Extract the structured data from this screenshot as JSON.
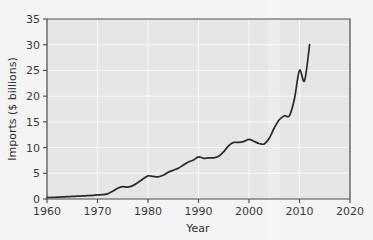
{
  "chart_data": {
    "type": "line",
    "title": "",
    "xlabel": "Year",
    "ylabel": "Imports ($ billions)",
    "xlim": [
      1960,
      2020
    ],
    "ylim": [
      0,
      35
    ],
    "xticks": [
      1960,
      1970,
      1980,
      1990,
      2000,
      2010,
      2020
    ],
    "yticks": [
      0,
      5,
      10,
      15,
      20,
      25,
      30,
      35
    ],
    "xtick_labels": [
      "1960",
      "1970",
      "1980",
      "1990",
      "2000",
      "2010",
      "2020"
    ],
    "ytick_labels": [
      "0",
      "5",
      "10",
      "15",
      "20",
      "25",
      "30",
      "35"
    ],
    "grid": true,
    "legend": "none",
    "series": [
      {
        "name": "Imports",
        "color": "#2b2b2b",
        "x": [
          1960,
          1961,
          1962,
          1963,
          1964,
          1965,
          1966,
          1967,
          1968,
          1969,
          1970,
          1971,
          1972,
          1973,
          1974,
          1975,
          1976,
          1977,
          1978,
          1979,
          1980,
          1981,
          1982,
          1983,
          1984,
          1985,
          1986,
          1987,
          1988,
          1989,
          1990,
          1991,
          1992,
          1993,
          1994,
          1995,
          1996,
          1997,
          1998,
          1999,
          2000,
          2001,
          2002,
          2003,
          2004,
          2005,
          2006,
          2007,
          2008,
          2009,
          2010,
          2011,
          2012
        ],
        "y": [
          0.3,
          0.3,
          0.35,
          0.4,
          0.45,
          0.5,
          0.55,
          0.6,
          0.65,
          0.7,
          0.8,
          0.85,
          1.0,
          1.5,
          2.1,
          2.4,
          2.3,
          2.6,
          3.2,
          3.9,
          4.5,
          4.4,
          4.3,
          4.6,
          5.2,
          5.6,
          6.0,
          6.6,
          7.2,
          7.6,
          8.2,
          7.9,
          8.0,
          8.0,
          8.3,
          9.2,
          10.4,
          11.0,
          11.0,
          11.2,
          11.6,
          11.2,
          10.8,
          10.7,
          11.8,
          13.8,
          15.4,
          16.2,
          16.2,
          19.5,
          25.0,
          23.0,
          30.0
        ]
      }
    ],
    "annotations": []
  },
  "figure": {
    "background_color": "#ffffff",
    "plot_background_color": "#e6e6e6",
    "gridline_color": "#ffffff",
    "axis_color": "#4a4a4a",
    "line_color": "#2b2b2b"
  }
}
